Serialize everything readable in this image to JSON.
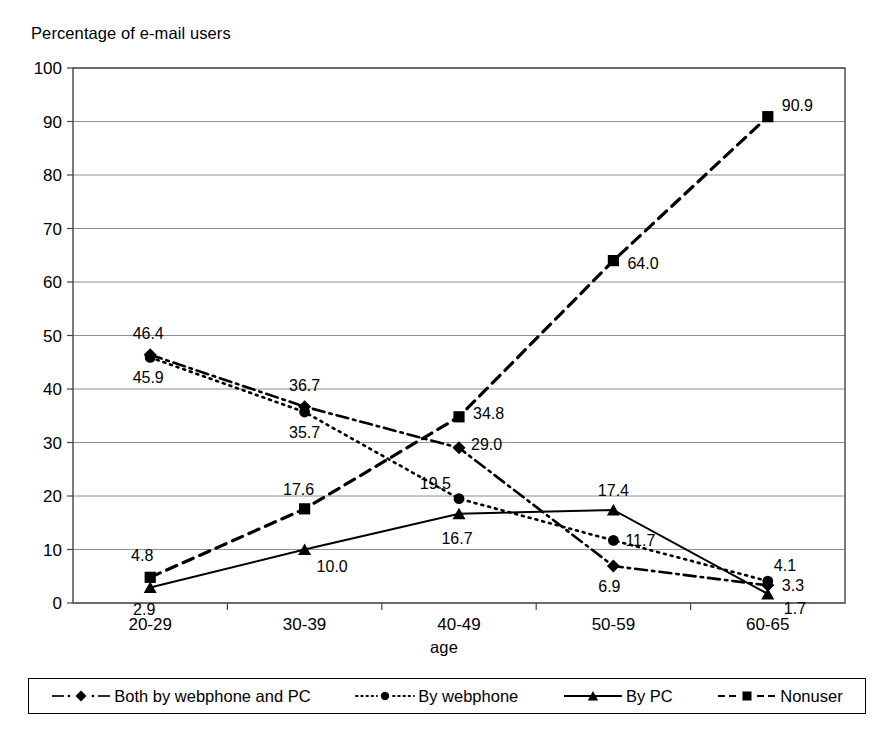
{
  "chart_data": {
    "type": "line",
    "title": "",
    "ylabel": "Percentage of e-mail users",
    "xlabel": "age",
    "categories": [
      "20-29",
      "30-39",
      "40-49",
      "50-59",
      "60-65"
    ],
    "ylim": [
      0,
      100
    ],
    "ytick_step": 10,
    "yticks": [
      "0",
      "10",
      "20",
      "30",
      "40",
      "50",
      "60",
      "70",
      "80",
      "90",
      "100"
    ],
    "grid": true,
    "legend_position": "bottom",
    "series": [
      {
        "name": "Both by webphone and PC",
        "marker": "diamond",
        "line_style": "dash-dot",
        "color": "#000000",
        "values": [
          46.4,
          36.7,
          29.0,
          6.9,
          3.3
        ],
        "labels": [
          "46.4",
          "36.7",
          "29.0",
          "6.9",
          "3.3"
        ]
      },
      {
        "name": "By webphone",
        "marker": "circle",
        "line_style": "dotted",
        "color": "#000000",
        "values": [
          45.9,
          35.7,
          19.5,
          11.7,
          4.1
        ],
        "labels": [
          "45.9",
          "35.7",
          "19.5",
          "11.7",
          "4.1"
        ]
      },
      {
        "name": "By PC",
        "marker": "triangle",
        "line_style": "solid",
        "color": "#000000",
        "values": [
          2.9,
          10.0,
          16.7,
          17.4,
          1.7
        ],
        "labels": [
          "2.9",
          "10.0",
          "16.7",
          "17.4",
          "1.7"
        ]
      },
      {
        "name": "Nonuser",
        "marker": "square",
        "line_style": "dashed",
        "color": "#000000",
        "values": [
          4.8,
          17.6,
          34.8,
          64.0,
          90.9
        ],
        "labels": [
          "4.8",
          "17.6",
          "34.8",
          "64.0",
          "90.9"
        ]
      }
    ]
  },
  "axes": {
    "y_title": "Percentage of e-mail users",
    "x_title": "age"
  },
  "legend": {
    "items": [
      {
        "label": "Both by webphone and PC",
        "marker": "diamond",
        "line_style": "dash-dot"
      },
      {
        "label": "By webphone",
        "marker": "circle",
        "line_style": "dotted"
      },
      {
        "label": "By PC",
        "marker": "triangle",
        "line_style": "solid"
      },
      {
        "label": "Nonuser",
        "marker": "square",
        "line_style": "dashed"
      }
    ]
  }
}
